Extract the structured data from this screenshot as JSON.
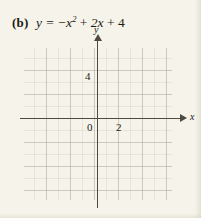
{
  "problem": {
    "label": "(b)",
    "equation_plain": "y = −x² + 2x + 4",
    "lhs": "y",
    "equals": "=",
    "neg_sign": "−",
    "term1_base": "x",
    "term1_exponent": "2",
    "plus1": "+",
    "term2": "2x",
    "plus2": "+",
    "constant": "4"
  },
  "graph": {
    "x_axis_label": "x",
    "y_axis_label": "y",
    "tick_labels": {
      "origin": "0",
      "x_two": "2",
      "y_four": "4"
    },
    "grid": {
      "visible": true,
      "minor_spacing_px": 12,
      "major_spacing_px": 24,
      "units_per_major": 2
    }
  },
  "chart_data": {
    "type": "line",
    "xlabel": "x",
    "ylabel": "y",
    "xlim": [
      -6,
      6
    ],
    "ylim": [
      -7,
      6
    ],
    "grid": true,
    "legend": "none",
    "xticks": [
      0,
      2
    ],
    "yticks": [
      4
    ],
    "series": [
      {
        "name": "y = −x² + 2x + 4",
        "plotted": false,
        "note": "grid is blank; student plots the parabola",
        "x": [],
        "values": []
      }
    ],
    "annotations": []
  },
  "colors": {
    "paper": "#f6f4ea",
    "ink": "#1d1a16",
    "axis": "#4e4a42",
    "grid_major": "#96928255",
    "grid_minor": "#b0ac9c4d"
  }
}
